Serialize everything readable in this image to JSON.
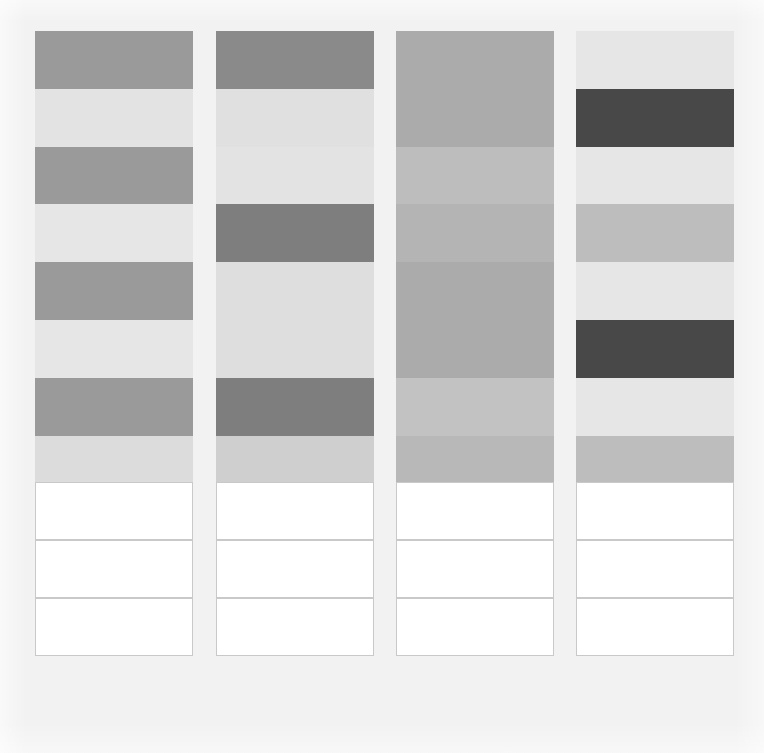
{
  "page": {
    "background_color": "#f2f2f2",
    "width": 764,
    "height": 753
  },
  "grid": {
    "columns": 4,
    "rows": 11,
    "column_width": 158,
    "row_height": 57.7,
    "origin_x": 35,
    "origin_y": 31,
    "column_gap": 23,
    "empty_cell_color": "#ffffff",
    "empty_cell_border_color": "#c9c9c9",
    "first_empty_row_index": 7
  },
  "chart_data": {
    "type": "heatmap",
    "title": "",
    "xlabel": "",
    "ylabel": "",
    "columns": [
      "Column 1",
      "Column 2",
      "Column 3",
      "Column 4"
    ],
    "rows": [
      "Row 1",
      "Row 2",
      "Row 3",
      "Row 4",
      "Row 5",
      "Row 6",
      "Row 7",
      "Row 8",
      "Row 9",
      "Row 10",
      "Row 11"
    ],
    "legend": [],
    "grid": false,
    "colors": [
      [
        "#9a9a9a",
        "#8a8a8a",
        "#ababab",
        "#e6e6e6"
      ],
      [
        "#e3e3e3",
        "#e0e0e0",
        "#ababab",
        "#484848"
      ],
      [
        "#9a9a9a",
        "#e3e3e3",
        "#bdbdbd",
        "#e6e6e6"
      ],
      [
        "#e6e6e6",
        "#7e7e7e",
        "#b4b4b4",
        "#bdbdbd"
      ],
      [
        "#9a9a9a",
        "#dedede",
        "#ababab",
        "#e6e6e6"
      ],
      [
        "#e6e6e6",
        "#dedede",
        "#ababab",
        "#484848"
      ],
      [
        "#9a9a9a",
        "#7e7e7e",
        "#c2c2c2",
        "#e6e6e6"
      ],
      [
        "#dcdcdc",
        "#cfcfcf",
        "#b8b8b8",
        "#bdbdbd"
      ],
      [
        "#ffffff",
        "#ffffff",
        "#ffffff",
        "#ffffff"
      ],
      [
        "#ffffff",
        "#ffffff",
        "#ffffff",
        "#ffffff"
      ],
      [
        "#ffffff",
        "#ffffff",
        "#ffffff",
        "#ffffff"
      ]
    ],
    "values": [
      [
        0.39,
        0.46,
        0.33,
        0.1
      ],
      [
        0.11,
        0.12,
        0.33,
        0.72
      ],
      [
        0.39,
        0.11,
        0.26,
        0.1
      ],
      [
        0.1,
        0.51,
        0.29,
        0.26
      ],
      [
        0.39,
        0.13,
        0.33,
        0.1
      ],
      [
        0.1,
        0.13,
        0.33,
        0.72
      ],
      [
        0.39,
        0.51,
        0.24,
        0.1
      ],
      [
        0.14,
        0.19,
        0.28,
        0.26
      ],
      [
        0.0,
        0.0,
        0.0,
        0.0
      ],
      [
        0.0,
        0.0,
        0.0,
        0.0
      ],
      [
        0.0,
        0.0,
        0.0,
        0.0
      ]
    ],
    "value_scale": "darkness (0 = white, 1 = black)",
    "column_x": [
      35,
      216,
      396,
      576
    ],
    "row_y": [
      31,
      89,
      147,
      204,
      262,
      320,
      378,
      436,
      482,
      540,
      598
    ]
  }
}
